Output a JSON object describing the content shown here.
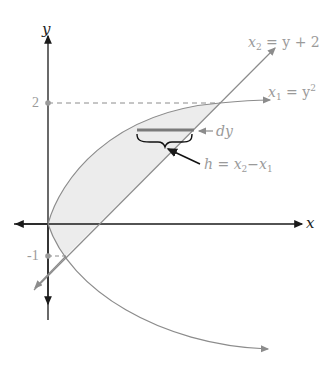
{
  "diagram": {
    "axes": {
      "x_label": "x",
      "y_label": "y"
    },
    "ticks": {
      "y_top": "2",
      "y_bottom": "-1"
    },
    "curves": {
      "line": {
        "lhs": "x",
        "lhs_sub": "2",
        "rhs": " = y + 2"
      },
      "parabola": {
        "lhs": "x",
        "lhs_sub": "1",
        "rhs": " = y",
        "rhs_sup": "2"
      }
    },
    "annotations": {
      "dy": "dy",
      "height_lhs": "h = x",
      "height_sub1": "2",
      "height_mid": "−x",
      "height_sub2": "1"
    },
    "colors": {
      "axis": "#1a1a1a",
      "curve": "#8c8c8c",
      "fill": "#eeeeee",
      "strip": "#7a7a7a",
      "label": "#9a9a9a"
    }
  }
}
